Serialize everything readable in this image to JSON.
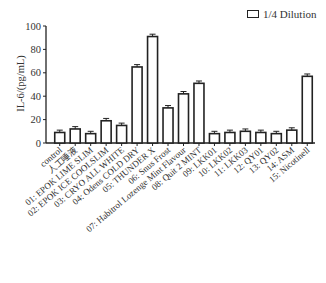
{
  "legend": {
    "label": "1/4 Dilution"
  },
  "chart_data": {
    "type": "bar",
    "title": "",
    "xlabel": "",
    "ylabel": "IL-6/(pg/mL)",
    "ylim": [
      0,
      100
    ],
    "yticks": [
      0,
      20,
      40,
      60,
      80,
      100
    ],
    "grid": false,
    "legend_position": "top-right",
    "categories": [
      "control",
      "人工唾液",
      "01: EPOK LIME SLIM",
      "02: EPOK ICE COOLSLIM",
      "03: CRYO ALL WHITE",
      "04: Odens COLD DRY",
      "05: THUNDER X",
      "06: Snus Frost",
      "07: Habitrol Lozenge Mint Flavour",
      "08: Quit 2 MINT",
      "09: LKK01",
      "10: LKK02",
      "11: LKK03",
      "12: QY01",
      "13: QY02",
      "14: ASM",
      "15: Nicotinell"
    ],
    "series": [
      {
        "name": "1/4 Dilution",
        "values": [
          9,
          12,
          8,
          19,
          15,
          65,
          91,
          30,
          42,
          51,
          8,
          9,
          10,
          9,
          8,
          11,
          57
        ],
        "errors": [
          2,
          2,
          2,
          2,
          2,
          2,
          2,
          2,
          2,
          2,
          2,
          2,
          2,
          2,
          2,
          2,
          2
        ]
      }
    ]
  }
}
